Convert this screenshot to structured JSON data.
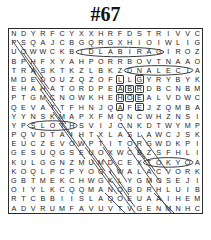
{
  "puzzle": {
    "title": "#67",
    "columns": 20,
    "rows": 16,
    "grid": [
      [
        "N",
        "D",
        "Y",
        "R",
        "F",
        "C",
        "Y",
        "X",
        "X",
        "H",
        "R",
        "F",
        "D",
        "S",
        "T",
        "R",
        "I",
        "V",
        "V",
        "C"
      ],
      [
        "P",
        "S",
        "Q",
        "A",
        "J",
        "C",
        "B",
        "G",
        "Q",
        "R",
        "G",
        "X",
        "H",
        "I",
        "O",
        "I",
        "W",
        "L",
        "I",
        "G"
      ],
      [
        "U",
        "O",
        "W",
        "W",
        "C",
        "K",
        "B",
        "I",
        "D",
        "L",
        "A",
        "B",
        "I",
        "R",
        "A",
        "G",
        "I",
        "R",
        "O",
        "Z"
      ],
      [
        "B",
        "P",
        "H",
        "F",
        "X",
        "Y",
        "A",
        "H",
        "P",
        "O",
        "R",
        "R",
        "B",
        "O",
        "V",
        "T",
        "N",
        "A",
        "A",
        "O"
      ],
      [
        "T",
        "R",
        "A",
        "S",
        "K",
        "T",
        "K",
        "Z",
        "L",
        "B",
        "K",
        "Z",
        "D",
        "N",
        "A",
        "L",
        "E",
        "C",
        "I",
        "A"
      ],
      [
        "M",
        "D",
        "E",
        "D",
        "O",
        "U",
        "Z",
        "Q",
        "Z",
        "O",
        "F",
        "L",
        "L",
        "G",
        "Y",
        "R",
        "Y",
        "B",
        "Y",
        "K"
      ],
      [
        "E",
        "H",
        "A",
        "H",
        "A",
        "T",
        "O",
        "R",
        "D",
        "P",
        "E",
        "A",
        "B",
        "R",
        "D",
        "B",
        "C",
        "N",
        "B",
        "M"
      ],
      [
        "P",
        "T",
        "G",
        "M",
        "C",
        "N",
        "O",
        "W",
        "K",
        "H",
        "E",
        "H",
        "O",
        "E",
        "A",
        "L",
        "V",
        "D",
        "W",
        "C"
      ],
      [
        "Q",
        "E",
        "V",
        "A",
        "T",
        "T",
        "F",
        "H",
        "N",
        "J",
        "Q",
        "A",
        "F",
        "E",
        "J",
        "Z",
        "Q",
        "M",
        "B",
        "A"
      ],
      [
        "Y",
        "Y",
        "N",
        "S",
        "K",
        "M",
        "A",
        "P",
        "X",
        "F",
        "M",
        "Q",
        "N",
        "C",
        "W",
        "H",
        "Z",
        "N",
        "S",
        "I"
      ],
      [
        "Y",
        "P",
        "S",
        "L",
        "O",
        "T",
        "H",
        "S",
        "V",
        "I",
        "J",
        "C",
        "N",
        "K",
        "D",
        "T",
        "W",
        "Y",
        "M",
        "P"
      ],
      [
        "P",
        "Q",
        "V",
        "D",
        "T",
        "A",
        "I",
        "H",
        "T",
        "X",
        "L",
        "A",
        "S",
        "L",
        "A",
        "W",
        "C",
        "J",
        "S",
        "K"
      ],
      [
        "E",
        "U",
        "C",
        "Z",
        "E",
        "V",
        "O",
        "W",
        "P",
        "T",
        "I",
        "T",
        "O",
        "R",
        "G",
        "W",
        "D",
        "K",
        "P",
        "I"
      ],
      [
        "G",
        "E",
        "S",
        "U",
        "Q",
        "G",
        "S",
        "E",
        "U",
        "O",
        "X",
        "W",
        "C",
        "B",
        "Z",
        "S",
        "F",
        "H",
        "L",
        "I"
      ],
      [
        "K",
        "U",
        "L",
        "G",
        "G",
        "N",
        "Z",
        "M",
        "U",
        "M",
        "D",
        "C",
        "E",
        "X",
        "T",
        "O",
        "K",
        "Y",
        "O",
        "A"
      ],
      [
        "K",
        "O",
        "Q",
        "L",
        "P",
        "C",
        "P",
        "Y",
        "O",
        "G",
        "I",
        "W",
        "A",
        "L",
        "A",
        "C",
        "V",
        "O",
        "R",
        "K"
      ],
      [
        "G",
        "B",
        "T",
        "M",
        "E",
        "K",
        "C",
        "H",
        "W",
        "G",
        "K",
        "L",
        "Y",
        "G",
        "M",
        "O",
        "S",
        "E",
        "J",
        "I"
      ],
      [
        "O",
        "I",
        "Y",
        "L",
        "K",
        "C",
        "Q",
        "Q",
        "M",
        "A",
        "N",
        "Q",
        "B",
        "D",
        "R",
        "H",
        "L",
        "U",
        "I",
        "B"
      ],
      [
        "R",
        "T",
        "C",
        "B",
        "B",
        "I",
        "I",
        "S",
        "L",
        "A",
        "Q",
        "O",
        "E",
        "U",
        "A",
        "A",
        "I",
        "H",
        "E",
        "M"
      ],
      [
        "A",
        "D",
        "V",
        "R",
        "U",
        "M",
        "F",
        "A",
        "V",
        "U",
        "V",
        "T",
        "V",
        "G",
        "E",
        "N",
        "M",
        "N",
        "H",
        "C"
      ]
    ],
    "boxed_cells": [
      {
        "row": 5,
        "col": 11
      },
      {
        "row": 5,
        "col": 13
      },
      {
        "row": 6,
        "col": 11
      },
      {
        "row": 6,
        "col": 12
      },
      {
        "row": 6,
        "col": 13
      },
      {
        "row": 7,
        "col": 11
      },
      {
        "row": 7,
        "col": 12
      },
      {
        "row": 7,
        "col": 13
      },
      {
        "row": 8,
        "col": 11
      },
      {
        "row": 8,
        "col": 13
      }
    ],
    "found_words": [
      {
        "text": "GARIBALDI",
        "shape": "ellipse",
        "row": 2,
        "col_start": 7,
        "col_end": 15
      },
      {
        "text": "ICELAND",
        "shape": "ellipse",
        "row": 4,
        "col_start": 12,
        "col_end": 18
      },
      {
        "text": "SLOTH",
        "shape": "ellipse",
        "row": 10,
        "col_start": 2,
        "col_end": 6
      },
      {
        "text": "TOKYO",
        "shape": "ellipse",
        "row": 14,
        "col_start": 14,
        "col_end": 18
      }
    ],
    "strike_lines": [
      {
        "x1": 3,
        "y1": 11,
        "x2": 27,
        "y2": 46
      },
      {
        "x1": 8,
        "y1": 11,
        "x2": 34,
        "y2": 48
      },
      {
        "x1": 14,
        "y1": 24,
        "x2": 40,
        "y2": 60
      },
      {
        "x1": 20,
        "y1": 36,
        "x2": 46,
        "y2": 72
      },
      {
        "x1": 26,
        "y1": 48,
        "x2": 52,
        "y2": 84
      },
      {
        "x1": 31,
        "y1": 60,
        "x2": 57,
        "y2": 95
      },
      {
        "x1": 37,
        "y1": 71,
        "x2": 63,
        "y2": 107
      },
      {
        "x1": 44,
        "y1": 83,
        "x2": 70,
        "y2": 118
      },
      {
        "x1": 50,
        "y1": 94,
        "x2": 76,
        "y2": 130
      },
      {
        "x1": 70,
        "y1": 106,
        "x2": 96,
        "y2": 142
      },
      {
        "x1": 76,
        "y1": 118,
        "x2": 102,
        "y2": 153
      },
      {
        "x1": 82,
        "y1": 130,
        "x2": 108,
        "y2": 165
      },
      {
        "x1": 94,
        "y1": 130,
        "x2": 120,
        "y2": 166
      },
      {
        "x1": 100,
        "y1": 142,
        "x2": 126,
        "y2": 178
      },
      {
        "x1": 120,
        "y1": 106,
        "x2": 146,
        "y2": 142
      },
      {
        "x1": 126,
        "y1": 118,
        "x2": 152,
        "y2": 154
      },
      {
        "x1": 132,
        "y1": 106,
        "x2": 158,
        "y2": 142
      },
      {
        "x1": 139,
        "y1": 152,
        "x2": 165,
        "y2": 188
      },
      {
        "x1": 145,
        "y1": 164,
        "x2": 171,
        "y2": 190
      },
      {
        "x1": 96,
        "y1": 164,
        "x2": 122,
        "y2": 190
      },
      {
        "x1": 103,
        "y1": 152,
        "x2": 129,
        "y2": 188
      }
    ],
    "strike_lines_back": [
      {
        "x1": 88,
        "y1": 106,
        "x2": 112,
        "y2": 142
      },
      {
        "x1": 94,
        "y1": 118,
        "x2": 118,
        "y2": 153
      },
      {
        "x1": 112,
        "y1": 94,
        "x2": 136,
        "y2": 130
      },
      {
        "x1": 119,
        "y1": 118,
        "x2": 143,
        "y2": 153
      }
    ],
    "colors": {
      "ink": "#1a1a1a",
      "frame": "#2b2b2b",
      "mark": "#39393f",
      "paper": "#ffffff"
    }
  }
}
